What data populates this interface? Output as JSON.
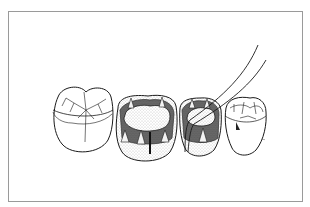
{
  "figure": {
    "colors": {
      "frame": "#9a9a9a",
      "ink": "#1a1a1a",
      "shade_dark": "#2b2b2b",
      "shade_mid": "#6a6a6a",
      "stipple": "#bdbdbd",
      "paper": "#ffffff"
    },
    "teeth": [
      {
        "id": "tooth-1",
        "type": "premolar",
        "state": "intact-occlusal-fissures"
      },
      {
        "id": "tooth-2",
        "type": "molar",
        "state": "prepared-cavity-with-pins"
      },
      {
        "id": "tooth-3",
        "type": "premolar",
        "state": "prepared-cavity-with-probe"
      },
      {
        "id": "tooth-4",
        "type": "premolar",
        "state": "intact-occlusal-fissures"
      }
    ],
    "instrument": {
      "name": "dental-probe"
    }
  }
}
